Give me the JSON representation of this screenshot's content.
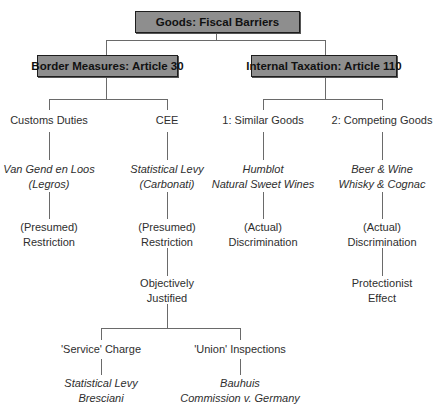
{
  "diagram": {
    "root": {
      "label": "Goods: Fiscal Barriers"
    },
    "branches": [
      {
        "label": "Border Measures: Article 30",
        "children": [
          {
            "label": "Customs Duties",
            "cases": [
              "Van Gend en Loos",
              "(Legros)"
            ],
            "result": [
              "(Presumed)",
              "Restriction"
            ]
          },
          {
            "label": "CEE",
            "cases": [
              "Statistical Levy",
              "(Carbonati)"
            ],
            "result": [
              "(Presumed)",
              "Restriction"
            ],
            "next": [
              "Objectively",
              "Justified"
            ],
            "children": [
              {
                "label": "'Service' Charge",
                "cases": [
                  "Statistical Levy",
                  "Bresciani"
                ]
              },
              {
                "label": "'Union' Inspections",
                "cases": [
                  "Bauhuis",
                  "Commission v. Germany"
                ]
              }
            ]
          }
        ]
      },
      {
        "label": "Internal Taxation: Article 110",
        "children": [
          {
            "label": "1: Similar Goods",
            "cases": [
              "Humblot",
              "Natural Sweet Wines"
            ],
            "result": [
              "(Actual)",
              "Discrimination"
            ]
          },
          {
            "label": "2: Competing Goods",
            "cases": [
              "Beer & Wine",
              "Whisky & Cognac"
            ],
            "result": [
              "(Actual)",
              "Discrimination"
            ],
            "next": [
              "Protectionist",
              "Effect"
            ]
          }
        ]
      }
    ]
  },
  "colors": {
    "box_fill": "#8e8e8e",
    "box_border": "#1e1e1e",
    "line": "#6a6a6a",
    "text": "#2e2e2e"
  }
}
